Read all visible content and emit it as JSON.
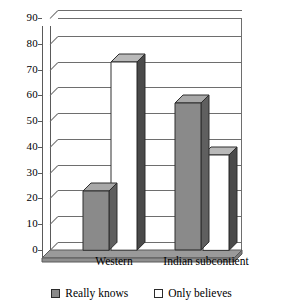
{
  "chart_data": {
    "type": "bar",
    "title": "",
    "subtitle": "",
    "xlabel": "",
    "ylabel": "",
    "categories": [
      "Western",
      "Indian subcontient"
    ],
    "series": [
      {
        "name": "Really knows",
        "values": [
          23,
          57
        ],
        "color": "#8a8a8a"
      },
      {
        "name": "Only believes",
        "values": [
          73,
          37
        ],
        "color": "#ffffff"
      }
    ],
    "ylim": [
      0,
      90
    ],
    "ytick_step": 10,
    "yticks": [
      "0",
      "10",
      "20",
      "30",
      "40",
      "50",
      "60",
      "70",
      "80",
      "90"
    ],
    "grid": true,
    "grid_axis": "y",
    "legend_position": "bottom",
    "style": "3d-column",
    "annotations": []
  },
  "axis": {
    "y_labels": [
      "90",
      "80",
      "70",
      "60",
      "50",
      "40",
      "30",
      "20",
      "10",
      "0"
    ],
    "x_labels": [
      "Western",
      "Indian subcontient"
    ]
  },
  "legend": {
    "items": [
      {
        "label": "Really knows",
        "swatch": "gray-swatch-icon"
      },
      {
        "label": "Only believes",
        "swatch": "white-swatch-icon"
      }
    ]
  },
  "colors": {
    "series_gray_front": "#8a8a8a",
    "series_gray_side": "#5f5f5f",
    "series_gray_top": "#a8a8a8",
    "series_white_front": "#ffffff",
    "series_white_side": "#4a4a4a",
    "series_white_top": "#b9b9b9",
    "gridline": "#6e6e6e",
    "floor": "#9a9a9a",
    "text": "#000000"
  }
}
